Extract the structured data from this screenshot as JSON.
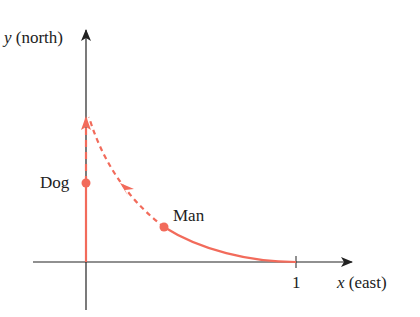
{
  "diagram": {
    "axes": {
      "y_label_var": "y",
      "y_label_dir": "(north)",
      "x_label_var": "x",
      "x_label_dir": "(east)",
      "x_tick_label": "1"
    },
    "points": {
      "dog_label": "Dog",
      "man_label": "Man"
    },
    "colors": {
      "path": "#f26b5b",
      "axis": "#222222",
      "text": "#222222"
    }
  }
}
